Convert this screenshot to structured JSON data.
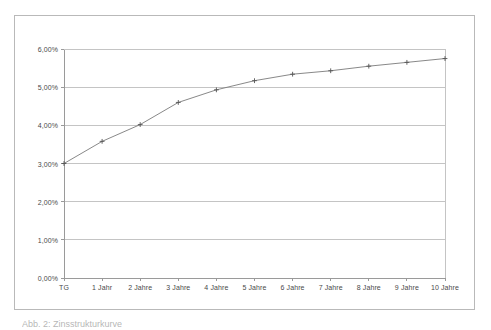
{
  "chart_data": {
    "type": "line",
    "title": "",
    "subtitle": "",
    "xlabel": "",
    "ylabel": "",
    "categories": [
      "TG",
      "1 Jahr",
      "2 Jahre",
      "3 Jahre",
      "4 Jahre",
      "5 Jahre",
      "6 Jahre",
      "7 Jahre",
      "8 Jahre",
      "9 Jahre",
      "10 Jahre"
    ],
    "values": [
      3.0,
      3.58,
      4.02,
      4.6,
      4.93,
      5.17,
      5.34,
      5.43,
      5.55,
      5.65,
      5.75
    ],
    "value_labels": [
      "3,00%",
      "3,58%",
      "4,02%",
      "4,60%",
      "4,93%",
      "5,17%",
      "5,34%",
      "5,43%",
      "5,55%",
      "5,65%",
      "5,75%"
    ],
    "ylim": [
      0,
      6
    ],
    "ytick_values": [
      0,
      1,
      2,
      3,
      4,
      5,
      6
    ],
    "ytick_labels": [
      "0,00%",
      "1,00%",
      "2,00%",
      "3,00%",
      "4,00%",
      "5,00%",
      "6,00%"
    ],
    "grid": true,
    "grid_axis": "y",
    "legend": false,
    "legend_position": "none",
    "marker": "plus",
    "line_color": "#7a7a7a",
    "grid_color": "#c4c4c4",
    "axis_color": "#9a9a9a",
    "frame_color": "#b9b9b9",
    "text_color": "#4a4a4a",
    "series_name": "Zinssatz"
  },
  "caption": {
    "text": "Abb. 2: Zinsstrukturkurve"
  }
}
